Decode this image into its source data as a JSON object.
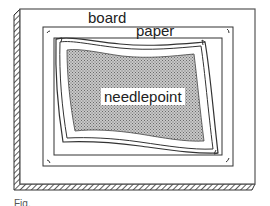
{
  "diagram": {
    "labels": {
      "board": "board",
      "paper": "paper",
      "needlepoint": "needlepoint",
      "figure_caption": "Fig."
    },
    "components": [
      {
        "id": "board",
        "description": "outer mounting board with hatched shadow edge"
      },
      {
        "id": "paper",
        "description": "paper sheet rectangle inside board"
      },
      {
        "id": "mat",
        "description": "inner rectangle border"
      },
      {
        "id": "needlepoint",
        "description": "wavy-edged stippled needlepoint piece with double border"
      },
      {
        "id": "corner-marks",
        "description": "small curved corner marks at paper corners"
      }
    ],
    "colors": {
      "line": "#333333",
      "stipple": "#9a9a9a",
      "background": "#ffffff"
    }
  }
}
